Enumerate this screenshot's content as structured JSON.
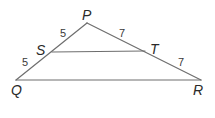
{
  "diagram": {
    "type": "triangle-with-midsegment",
    "vertices": {
      "P": {
        "label": "P",
        "x": 87,
        "y": 23
      },
      "Q": {
        "label": "Q",
        "x": 16,
        "y": 80
      },
      "R": {
        "label": "R",
        "x": 201,
        "y": 80
      },
      "S": {
        "label": "S",
        "x": 52,
        "y": 52
      },
      "T": {
        "label": "T",
        "x": 145,
        "y": 51
      }
    },
    "segments": [
      {
        "from": "P",
        "to": "Q"
      },
      {
        "from": "P",
        "to": "R"
      },
      {
        "from": "Q",
        "to": "R"
      },
      {
        "from": "S",
        "to": "T"
      }
    ],
    "measurements": {
      "PS": "5",
      "SQ": "5",
      "PT": "7",
      "TR": "7"
    },
    "colors": {
      "line": "#6e6e6e",
      "text": "#2a2a2a"
    }
  }
}
